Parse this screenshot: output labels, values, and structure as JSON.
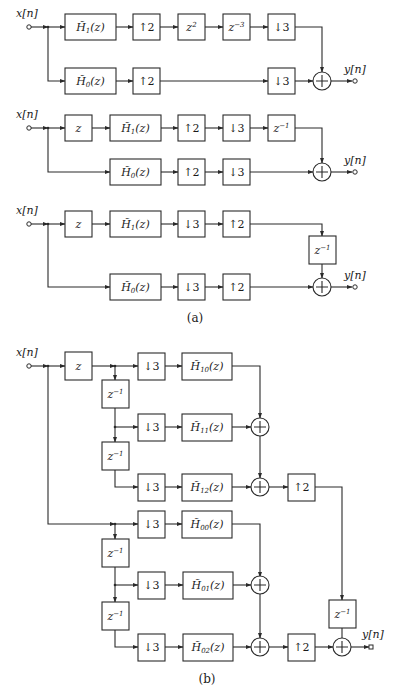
{
  "figure": {
    "subfigure_a": {
      "caption": "(a)",
      "diagram_1": {
        "input_label": "x[n]",
        "output_label": "y[n]",
        "top_branch": [
          {
            "type": "filter",
            "label": "H̃",
            "sub": "1",
            "arg": "(z)"
          },
          {
            "type": "upsampler",
            "label": "↑2"
          },
          {
            "type": "delay",
            "label": "z",
            "sup": "2"
          },
          {
            "type": "delay",
            "label": "z",
            "sup": "−3"
          },
          {
            "type": "downsampler",
            "label": "↓3"
          }
        ],
        "bottom_branch": [
          {
            "type": "filter",
            "label": "H̃",
            "sub": "0",
            "arg": "(z)"
          },
          {
            "type": "upsampler",
            "label": "↑2"
          },
          {
            "type": "downsampler",
            "label": "↓3"
          }
        ],
        "combiner": "+"
      },
      "diagram_2": {
        "input_label": "x[n]",
        "output_label": "y[n]",
        "top_branch": [
          {
            "type": "delay",
            "label": "z"
          },
          {
            "type": "filter",
            "label": "H̃",
            "sub": "1",
            "arg": "(z)"
          },
          {
            "type": "upsampler",
            "label": "↑2"
          },
          {
            "type": "downsampler",
            "label": "↓3"
          },
          {
            "type": "delay",
            "label": "z",
            "sup": "−1"
          }
        ],
        "bottom_branch": [
          {
            "type": "filter",
            "label": "H̃",
            "sub": "0",
            "arg": "(z)"
          },
          {
            "type": "upsampler",
            "label": "↑2"
          },
          {
            "type": "downsampler",
            "label": "↓3"
          }
        ],
        "combiner": "+"
      },
      "diagram_3": {
        "input_label": "x[n]",
        "output_label": "y[n]",
        "top_branch": [
          {
            "type": "delay",
            "label": "z"
          },
          {
            "type": "filter",
            "label": "H̃",
            "sub": "1",
            "arg": "(z)"
          },
          {
            "type": "downsampler",
            "label": "↓3"
          },
          {
            "type": "upsampler",
            "label": "↑2"
          },
          {
            "type": "delay",
            "label": "z",
            "sup": "−1"
          }
        ],
        "bottom_branch": [
          {
            "type": "filter",
            "label": "H̃",
            "sub": "0",
            "arg": "(z)"
          },
          {
            "type": "downsampler",
            "label": "↓3"
          },
          {
            "type": "upsampler",
            "label": "↑2"
          }
        ],
        "combiner": "+"
      }
    },
    "subfigure_b": {
      "caption": "(b)",
      "input_label": "x[n]",
      "output_label": "y[n]",
      "front_delay": {
        "label": "z"
      },
      "chain_delay": {
        "label": "z",
        "sup": "−1"
      },
      "downsampler": "↓3",
      "upsampler": "↑2",
      "polyphase_upper": [
        {
          "label": "H̃",
          "sub": "10",
          "arg": "(z)"
        },
        {
          "label": "H̃",
          "sub": "11",
          "arg": "(z)"
        },
        {
          "label": "H̃",
          "sub": "12",
          "arg": "(z)"
        }
      ],
      "polyphase_lower": [
        {
          "label": "H̃",
          "sub": "00",
          "arg": "(z)"
        },
        {
          "label": "H̃",
          "sub": "01",
          "arg": "(z)"
        },
        {
          "label": "H̃",
          "sub": "02",
          "arg": "(z)"
        }
      ],
      "output_delay": {
        "label": "z",
        "sup": "−1"
      },
      "combiner": "+"
    }
  }
}
